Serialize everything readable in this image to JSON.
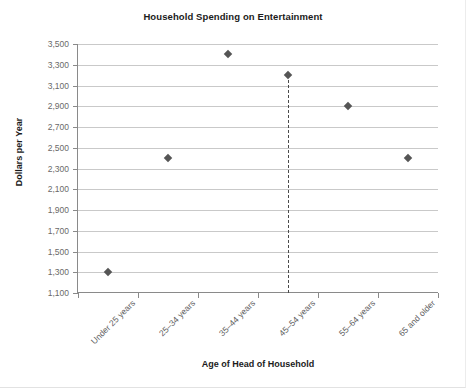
{
  "chart_data": {
    "type": "scatter",
    "title": "Household Spending on Entertainment",
    "xlabel": "Age of Head of Household",
    "ylabel": "Dollars per Year",
    "categories": [
      "Under 25 years",
      "25–34 years",
      "35–44 years",
      "45–54 years",
      "55–64 years",
      "65 and older"
    ],
    "values": [
      1300,
      2400,
      3400,
      3200,
      2900,
      2400
    ],
    "ylim": [
      1100,
      3500
    ],
    "ytick_step": 200,
    "ytick_labels": [
      "3,500",
      "3,300",
      "3,100",
      "2,900",
      "2,700",
      "2,500",
      "2,300",
      "2,100",
      "1,900",
      "1,700",
      "1,500",
      "1,300",
      "1,100"
    ],
    "ytick_values": [
      3500,
      3300,
      3100,
      2900,
      2700,
      2500,
      2300,
      2100,
      1900,
      1700,
      1500,
      1300,
      1100
    ],
    "grid": "horizontal",
    "legend": "none",
    "annotations": [
      {
        "type": "vertical-dashed-line",
        "at_category": "45–54 years",
        "from_value": 3200,
        "to_value": 1100
      }
    ],
    "marker": "diamond",
    "marker_color": "#555555",
    "grid_color": "#c9c9c9",
    "axis_color": "#8a8a8a"
  }
}
